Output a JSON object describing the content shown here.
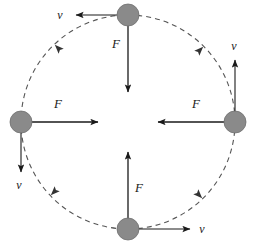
{
  "diagram": {
    "background_color": "#ffffff",
    "stroke_color": "#1a1a1a",
    "ball_color": "#8a8a8a",
    "ball_stroke": "#6f6f6f",
    "path": {
      "shape": "circle",
      "style": "dashed",
      "center_x": 128,
      "center_y": 122,
      "radius": 107,
      "direction": "clockwise"
    },
    "balls": [
      {
        "name": "top",
        "cx": 128,
        "cy": 15,
        "r": 11
      },
      {
        "name": "left",
        "cx": 21,
        "cy": 122,
        "r": 11
      },
      {
        "name": "right",
        "cx": 235,
        "cy": 122,
        "r": 11
      },
      {
        "name": "bottom",
        "cx": 128,
        "cy": 229,
        "r": 11
      }
    ],
    "force_vectors": [
      {
        "name": "force-top",
        "label": "F",
        "direction": "down",
        "x1": 128,
        "y1": 18,
        "x2": 128,
        "y2": 92,
        "label_x": 116,
        "label_y": 48
      },
      {
        "name": "force-left",
        "label": "F",
        "direction": "right",
        "x1": 24,
        "y1": 122,
        "x2": 98,
        "y2": 122,
        "label_x": 58,
        "label_y": 108
      },
      {
        "name": "force-right",
        "label": "F",
        "direction": "left",
        "x1": 232,
        "y1": 122,
        "x2": 158,
        "y2": 122,
        "label_x": 196,
        "label_y": 108
      },
      {
        "name": "force-bottom",
        "label": "F",
        "direction": "up",
        "x1": 128,
        "y1": 226,
        "x2": 128,
        "y2": 152,
        "label_x": 139,
        "label_y": 192
      }
    ],
    "velocity_vectors": [
      {
        "name": "velocity-top",
        "label": "v",
        "direction": "left",
        "x1": 128,
        "y1": 15,
        "x2": 74,
        "y2": 15,
        "label_x": 60,
        "label_y": 19
      },
      {
        "name": "velocity-left",
        "label": "v",
        "direction": "down",
        "x1": 21,
        "y1": 122,
        "x2": 21,
        "y2": 172,
        "label_x": 16,
        "label_y": 188
      },
      {
        "name": "velocity-right",
        "label": "v",
        "direction": "up",
        "x1": 235,
        "y1": 122,
        "x2": 235,
        "y2": 58,
        "label_x": 232,
        "label_y": 50
      },
      {
        "name": "velocity-bottom",
        "label": "v",
        "direction": "right",
        "x1": 128,
        "y1": 229,
        "x2": 192,
        "y2": 229,
        "label_x": 200,
        "label_y": 233
      }
    ],
    "path_direction_markers": [
      {
        "name": "path-arrow-upper-left",
        "x": 58,
        "y": 48,
        "angle": 225
      },
      {
        "name": "path-arrow-upper-right",
        "x": 200,
        "y": 50,
        "angle": 315
      },
      {
        "name": "path-arrow-lower-left",
        "x": 54,
        "y": 192,
        "angle": 135
      },
      {
        "name": "path-arrow-lower-right",
        "x": 199,
        "y": 195,
        "angle": 45
      }
    ]
  }
}
